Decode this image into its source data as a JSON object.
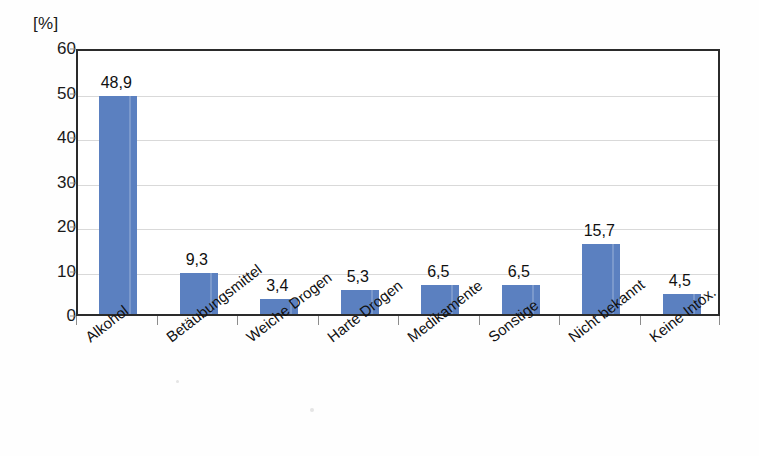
{
  "chart_data": {
    "type": "bar",
    "title": "",
    "subtitle": "",
    "xlabel": "",
    "ylabel": "[%]",
    "unit_label": "[%]",
    "categories": [
      "Alkohol",
      "Betäubungsmittel",
      "Weiche Drogen",
      "Harte Drogen",
      "Medikamente",
      "Sonstige",
      "Nicht bekannt",
      "Keine Intox."
    ],
    "values": [
      48.9,
      9.3,
      3.4,
      5.3,
      6.5,
      6.5,
      15.7,
      4.5
    ],
    "value_labels": [
      "48,9",
      "9,3",
      "3,4",
      "5,3",
      "6,5",
      "6,5",
      "15,7",
      "4,5"
    ],
    "ylim": [
      0,
      60
    ],
    "yticks": [
      0,
      10,
      20,
      30,
      40,
      50,
      60
    ],
    "ytick_labels": [
      "0",
      "10",
      "20",
      "30",
      "40",
      "50",
      "60"
    ],
    "grid": true,
    "grid_axis": "y",
    "legend": false,
    "legend_position": "none",
    "decimal_separator": ",",
    "series": [
      {
        "name": "Anteil",
        "values": [
          48.9,
          9.3,
          3.4,
          5.3,
          6.5,
          6.5,
          15.7,
          4.5
        ]
      }
    ]
  },
  "style": {
    "bar_color": "#5b80c0",
    "frame_color": "#2b2b2b",
    "grid_color": "#d9d9d9",
    "text_color": "#111111",
    "background": "#fefefe"
  }
}
